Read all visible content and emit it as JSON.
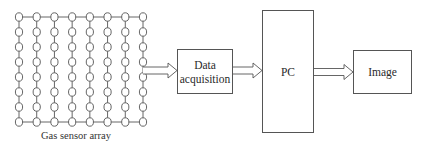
{
  "diagram": {
    "sensor_array": {
      "label": "Gas sensor array",
      "rows": 8,
      "cols": 8
    },
    "blocks": [
      {
        "id": "data-acquisition",
        "line1": "Data",
        "line2": "acquisition"
      },
      {
        "id": "pc",
        "label": "PC"
      },
      {
        "id": "image",
        "label": "Image"
      }
    ],
    "arrows": [
      {
        "from": "sensor-array",
        "to": "data-acquisition"
      },
      {
        "from": "data-acquisition",
        "to": "pc"
      },
      {
        "from": "pc",
        "to": "image"
      }
    ]
  }
}
